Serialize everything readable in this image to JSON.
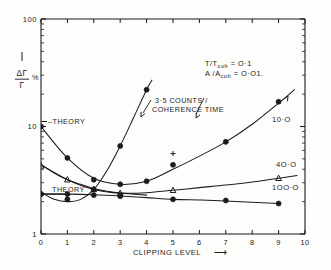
{
  "figure": {
    "background": "#fdfdfb",
    "ink": "#1b1b1b"
  },
  "axes": {
    "x": {
      "label": "CLIPPING  LEVEL",
      "label_arrow": "⟶",
      "scale": "linear",
      "min": 0,
      "max": 10,
      "ticks": [
        "0",
        "1",
        "2",
        "3",
        "4",
        "5",
        "6",
        "7",
        "8",
        "9",
        "10"
      ]
    },
    "y": {
      "label_numerator": "ΔΓ",
      "label_denominator": "Γ",
      "label_percent": "%",
      "scale": "log",
      "min": 1,
      "max": 100,
      "ticks": [
        "1",
        "10",
        "100"
      ]
    }
  },
  "annotations": {
    "params_line1": "T/Tcoh = O·1",
    "params_line1_base": "T/T",
    "params_line1_sub": "coh",
    "params_line1_val": "= O·1",
    "params_line2_base": "A /A",
    "params_line2_sub": "coh",
    "params_line2_val": "= O·O1.",
    "counts_line1": "3·5 COUNTS /",
    "counts_line2": "COHERENCE  TIME",
    "theory_upper": "–THEORY",
    "theory_lower": "THEORY",
    "curve_label_10": "10·O",
    "curve_label_40": "4O·O",
    "curve_label_100": "1OO·O"
  },
  "chart_data": {
    "type": "line",
    "title": "",
    "xlabel": "CLIPPING LEVEL",
    "ylabel": "ΔΓ/Γ %",
    "xlim": [
      0,
      10
    ],
    "ylim": [
      1,
      100
    ],
    "yscale": "log",
    "xscale": "linear",
    "grid": false,
    "legend": "inline-right-labels",
    "series": [
      {
        "name": "3·5 COUNTS / COHERENCE TIME",
        "label": "3·5 COUNTS / COHERENCE TIME",
        "marker": "filled-circle",
        "x": [
          0,
          1,
          2,
          3,
          4
        ],
        "y": [
          2.35,
          2.1,
          2.6,
          6.6,
          22.0
        ],
        "curve_x": [
          0,
          0.5,
          1,
          1.5,
          2,
          2.5,
          3,
          3.5,
          4,
          4.2
        ],
        "curve_y": [
          2.45,
          2.1,
          2.0,
          2.1,
          2.6,
          3.9,
          6.6,
          12.0,
          22.0,
          27.0
        ]
      },
      {
        "name": "10·O",
        "label": "10·O",
        "marker": "filled-circle",
        "x": [
          0,
          1,
          2,
          3,
          4,
          5,
          7,
          9
        ],
        "y": [
          10.0,
          5.1,
          3.2,
          2.9,
          3.1,
          4.4,
          7.2,
          17.0
        ],
        "curve_x": [
          0,
          1,
          2,
          3,
          4,
          5,
          6,
          7,
          8,
          9,
          9.6
        ],
        "curve_y": [
          10.0,
          5.1,
          3.3,
          2.9,
          3.1,
          4.0,
          5.3,
          7.2,
          10.5,
          16.5,
          22.0
        ]
      },
      {
        "name": "4O·O",
        "label": "4O·O",
        "marker": "triangle",
        "x": [
          0,
          1,
          2,
          3,
          5,
          9
        ],
        "y": [
          4.3,
          3.2,
          2.6,
          2.4,
          2.55,
          3.3
        ],
        "curve_x": [
          0,
          1,
          2,
          3,
          4,
          5,
          6,
          7,
          8,
          9,
          9.7
        ],
        "curve_y": [
          4.4,
          3.2,
          2.6,
          2.4,
          2.42,
          2.55,
          2.7,
          2.85,
          3.05,
          3.3,
          3.5
        ]
      },
      {
        "name": "1OO·O",
        "label": "1OO·O",
        "marker": "filled-circle",
        "x": [
          0,
          1,
          2,
          3,
          5,
          7,
          9
        ],
        "y": [
          2.35,
          2.35,
          2.3,
          2.25,
          2.1,
          2.05,
          1.92
        ],
        "curve_x": [
          0,
          1,
          2,
          3,
          4,
          5,
          6,
          7,
          8,
          9
        ],
        "curve_y": [
          2.35,
          2.35,
          2.32,
          2.26,
          2.18,
          2.1,
          2.07,
          2.03,
          1.97,
          1.92
        ]
      },
      {
        "name": "plus-points",
        "label": "",
        "marker": "plus",
        "x": [
          5,
          7
        ],
        "y": [
          5.6,
          7.2
        ]
      },
      {
        "name": "theory-upper",
        "label": "THEORY",
        "marker": "none",
        "curve_x": [
          0,
          0.5,
          1,
          1.5,
          2,
          2.5,
          3,
          3.5,
          4
        ],
        "curve_y": [
          4.4,
          3.7,
          3.2,
          2.9,
          2.65,
          2.5,
          2.4,
          2.35,
          2.3
        ]
      },
      {
        "name": "theory-lower",
        "label": "THEORY",
        "marker": "none",
        "curve_x": [
          0,
          1
        ],
        "curve_y": [
          2.35,
          2.35
        ]
      }
    ]
  }
}
